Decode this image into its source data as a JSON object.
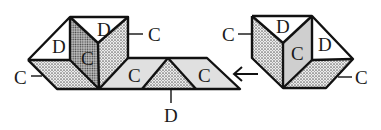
{
  "diagram": {
    "type": "folding-net",
    "colors": {
      "stroke": "#111111",
      "white_face": "#ffffff",
      "light_face": "#e2e2e2",
      "dotted_face_base": "#d0d0d0",
      "dark_dotted_face_base": "#a9a9a9"
    },
    "left_figure": {
      "labels": {
        "top_left_triangle": "D",
        "center_dark_face": "C",
        "top_triangle": "D",
        "right_leader": "C",
        "left_leader": "C",
        "strip_left_face": "C",
        "strip_right_face": "C",
        "strip_bottom_leader": "D"
      }
    },
    "right_figure": {
      "labels": {
        "left_leader": "C",
        "top_triangle": "D",
        "center_face": "C",
        "right_triangle": "D",
        "right_leader": "C"
      }
    },
    "arrow": {
      "direction": "left",
      "glyph": "←"
    }
  }
}
